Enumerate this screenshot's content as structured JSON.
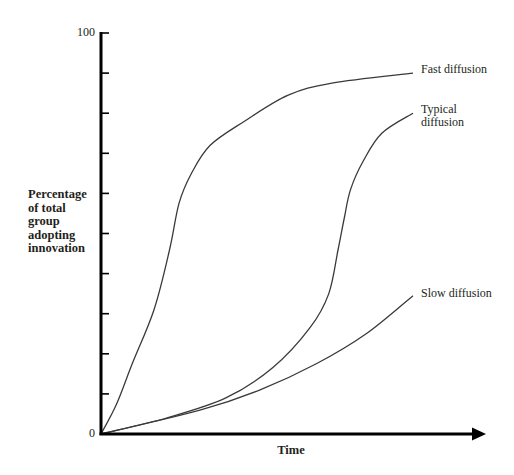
{
  "chart_data": {
    "type": "line",
    "title": "",
    "xlabel": "Time",
    "ylabel": "Percentage of total group adopting innovation",
    "ylabel_lines": [
      "Percentage",
      "of total",
      "group",
      "adopting",
      "innovation"
    ],
    "ylim": [
      0,
      100
    ],
    "xlim": [
      0,
      100
    ],
    "y_tick_labels": [
      "0",
      "100"
    ],
    "y_ticks": [
      0,
      10,
      20,
      30,
      40,
      50,
      60,
      70,
      80,
      90,
      100
    ],
    "x_ticks": [],
    "grid": false,
    "legend_position": "inline-right",
    "series": [
      {
        "name": "Fast diffusion",
        "label_lines": [
          "Fast diffusion"
        ],
        "x": [
          0,
          5,
          10,
          17,
          22,
          25,
          29,
          35,
          46,
          60,
          74,
          100
        ],
        "values": [
          0,
          7.5,
          17.5,
          31,
          46,
          57.5,
          65,
          72,
          78,
          84.5,
          87.5,
          90
        ]
      },
      {
        "name": "Typical diffusion",
        "label_lines": [
          "Typical",
          "diffusion"
        ],
        "x": [
          0,
          21,
          40,
          55,
          67,
          73,
          76,
          78,
          80,
          84,
          90,
          100
        ],
        "values": [
          0,
          4,
          9,
          16.5,
          26.5,
          35,
          46,
          54,
          61,
          68,
          75,
          80
        ]
      },
      {
        "name": "Slow diffusion",
        "label_lines": [
          "Slow diffusion"
        ],
        "x": [
          0,
          32,
          51,
          69,
          85,
          100
        ],
        "values": [
          0,
          6,
          11,
          17.5,
          25,
          34.5
        ]
      }
    ]
  },
  "labels": {
    "y_top": "100",
    "y_bottom": "0",
    "x_title": "Time",
    "y_title": [
      "Percentage",
      "of total",
      "group",
      "adopting",
      "innovation"
    ],
    "fast": "Fast diffusion",
    "typical_line1": "Typical",
    "typical_line2": "diffusion",
    "slow": "Slow diffusion"
  },
  "colors": {
    "axis": "#000000",
    "curve": "#3a3a3a",
    "text": "#231f20"
  }
}
